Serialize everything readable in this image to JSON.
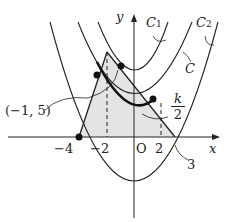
{
  "diagram": {
    "axes": {
      "x_label": "x",
      "y_label": "y",
      "origin_label": "O"
    },
    "x_ticks": [
      "−4",
      "−2",
      "2"
    ],
    "curve_labels": {
      "c1": "C",
      "c1_sub": "1",
      "c2": "C",
      "c2_sub": "2",
      "c": "C"
    },
    "point_label": "(−1, 5)",
    "fraction": {
      "num": "k",
      "den": "2"
    },
    "annotation_3": "3",
    "colors": {
      "line": "#222222",
      "shade": "#e4e4e4"
    }
  }
}
